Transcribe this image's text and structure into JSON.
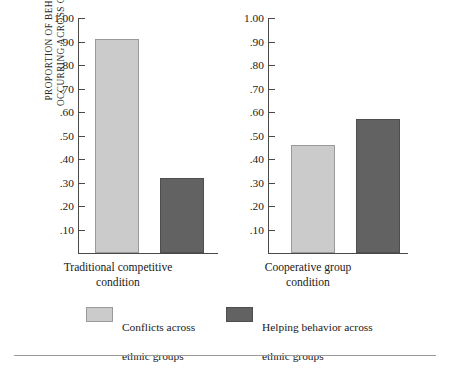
{
  "chart_data": {
    "type": "bar",
    "title": "",
    "xlabel": "",
    "ylabel": "PROPORTION OF BEHAVIOR OCCURRING ACROSS GROUPS",
    "ylabel_lines": [
      "PROPORTION OF BEHAVIOR",
      "OCCURRING ACROSS GROUPS"
    ],
    "ylim": [
      0,
      1.0
    ],
    "ytick_values": [
      1.0,
      0.9,
      0.8,
      0.7,
      0.6,
      0.5,
      0.4,
      0.3,
      0.2,
      0.1
    ],
    "ytick_labels": [
      "1.00",
      ".90",
      ".80",
      ".70",
      ".60",
      ".50",
      ".40",
      ".30",
      ".20",
      ".10"
    ],
    "grid": false,
    "legend_position": "bottom",
    "panels": [
      {
        "name": "panel-traditional-competitive",
        "category_lines": [
          "Traditional competitive",
          "condition"
        ],
        "category": "Traditional competitive condition",
        "bars": [
          {
            "series": "Conflicts across ethnic groups",
            "value": 0.91,
            "color": "#cbcbcb"
          },
          {
            "series": "Helping behavior across ethnic groups",
            "value": 0.32,
            "color": "#626262"
          }
        ]
      },
      {
        "name": "panel-cooperative-group",
        "category_lines": [
          "Cooperative group",
          "condition"
        ],
        "category": "Cooperative group condition",
        "bars": [
          {
            "series": "Conflicts across ethnic groups",
            "value": 0.46,
            "color": "#cbcbcb"
          },
          {
            "series": "Helping behavior across ethnic groups",
            "value": 0.57,
            "color": "#626262"
          }
        ]
      }
    ],
    "categories": [
      "Traditional competitive condition",
      "Cooperative group condition"
    ],
    "series": [
      {
        "name": "Conflicts across ethnic groups",
        "values": [
          0.91,
          0.46
        ],
        "color": "#cbcbcb"
      },
      {
        "name": "Helping behavior across ethnic groups",
        "values": [
          0.32,
          0.57
        ],
        "color": "#626262"
      }
    ],
    "legend": [
      {
        "label_lines": [
          "Conflicts across",
          "ethnic groups"
        ],
        "label": "Conflicts across ethnic groups",
        "color": "#cbcbcb"
      },
      {
        "label_lines": [
          "Helping behavior across",
          "ethnic groups"
        ],
        "label": "Helping behavior across ethnic groups",
        "color": "#626262"
      }
    ]
  }
}
